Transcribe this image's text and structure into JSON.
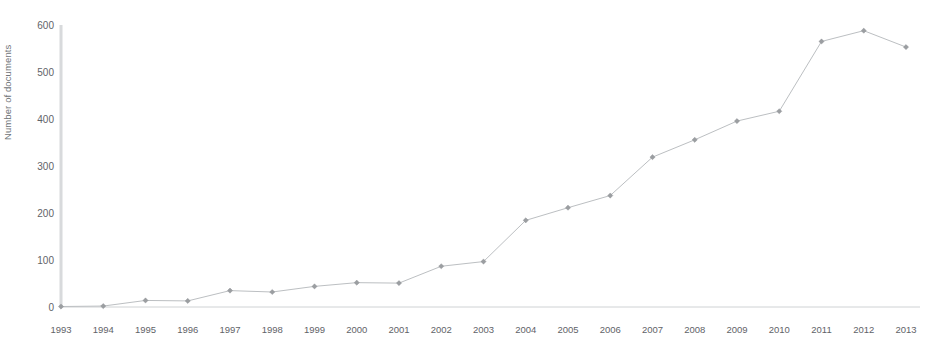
{
  "chart_data": {
    "type": "line",
    "title": "",
    "subtitle": "",
    "xlabel": "",
    "ylabel": "Number of documents",
    "categories": [
      "1993",
      "1994",
      "1995",
      "1996",
      "1997",
      "1998",
      "1999",
      "2000",
      "2001",
      "2002",
      "2003",
      "2004",
      "2005",
      "2006",
      "2007",
      "2008",
      "2009",
      "2010",
      "2011",
      "2012",
      "2013"
    ],
    "x": [
      1993,
      1994,
      1995,
      1996,
      1997,
      1998,
      1999,
      2000,
      2001,
      2002,
      2003,
      2004,
      2005,
      2006,
      2007,
      2008,
      2009,
      2010,
      2011,
      2012,
      2013
    ],
    "values": [
      1,
      2,
      14,
      13,
      35,
      32,
      44,
      52,
      51,
      87,
      97,
      185,
      212,
      238,
      320,
      357,
      397,
      418,
      567,
      590,
      555
    ],
    "series": [
      {
        "name": "Number of documents",
        "values": [
          1,
          2,
          14,
          13,
          35,
          32,
          44,
          52,
          51,
          87,
          97,
          185,
          212,
          238,
          320,
          357,
          397,
          418,
          567,
          590,
          555
        ]
      }
    ],
    "ylim": [
      0,
      600
    ],
    "yticks": [
      0,
      100,
      200,
      300,
      400,
      500,
      600
    ],
    "ytick_labels": [
      "0",
      "100",
      "200",
      "300",
      "400",
      "500",
      "600"
    ],
    "xtick_labels": [
      "1993",
      "1994",
      "1995",
      "1996",
      "1997",
      "1998",
      "1999",
      "2000",
      "2001",
      "2002",
      "2003",
      "2004",
      "2005",
      "2006",
      "2007",
      "2008",
      "2009",
      "2010",
      "2011",
      "2012",
      "2013"
    ],
    "grid": false,
    "legend": false,
    "legend_position": "none",
    "marker": "diamond",
    "annotations": [],
    "colors": {
      "line": "#bcbfc2",
      "marker": "#9b9ea1",
      "axis": "#cfd2d4",
      "tick_text": "#5f6368",
      "axis_title": "#6f7377",
      "background": "#ffffff"
    }
  }
}
